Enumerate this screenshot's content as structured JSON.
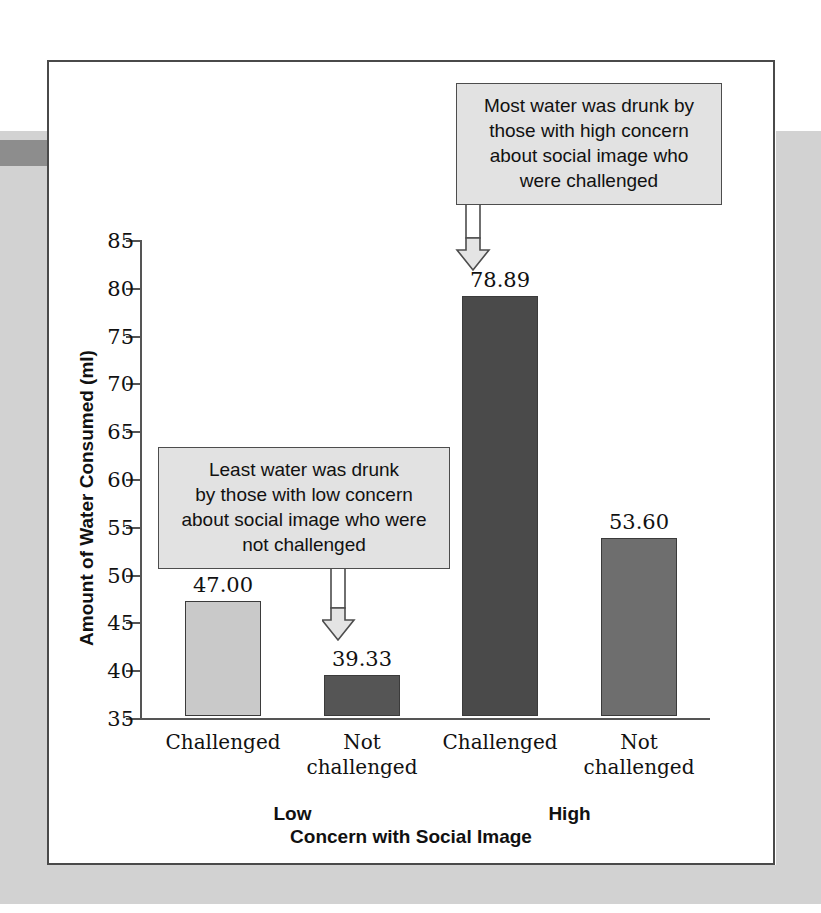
{
  "chart_data": {
    "type": "bar",
    "title": "",
    "xlabel": "Concern with Social Image",
    "ylabel": "Amount of Water Consumed (ml)",
    "ylim": [
      35,
      85
    ],
    "ytick_values": [
      85,
      80,
      75,
      70,
      65,
      60,
      55,
      50,
      45,
      40,
      35
    ],
    "ytick_labels": [
      "85",
      "80",
      "75",
      "70",
      "65",
      "60",
      "55",
      "50",
      "45",
      "40",
      "35"
    ],
    "grid": false,
    "legend": "none",
    "categories": [
      "Challenged",
      "Not challenged",
      "Challenged",
      "Not challenged"
    ],
    "group_labels": [
      "Low",
      "High"
    ],
    "values": [
      47.0,
      39.33,
      78.89,
      53.6
    ],
    "value_labels": [
      "47.00",
      "39.33",
      "78.89",
      "53.60"
    ],
    "bar_colors": [
      "#c9c9c9",
      "#555555",
      "#4a4a4a",
      "#6e6e6e"
    ],
    "bars": [
      {
        "label": "Challenged",
        "group": "Low",
        "value": 47.0,
        "value_label": "47.00",
        "color": "#c9c9c9"
      },
      {
        "label": "Not\nchallenged",
        "group": "Low",
        "value": 39.33,
        "value_label": "39.33",
        "color": "#555555"
      },
      {
        "label": "Challenged",
        "group": "High",
        "value": 78.89,
        "value_label": "78.89",
        "color": "#4a4a4a"
      },
      {
        "label": "Not\nchallenged",
        "group": "High",
        "value": 53.6,
        "value_label": "53.60",
        "color": "#6e6e6e"
      }
    ],
    "annotations": [
      {
        "id": "high-concern-challenged",
        "text": "Most water was drunk by those with high concern about social image who were challenged",
        "lines": [
          "Most water was drunk by",
          "those with high concern",
          "about social image who",
          "were challenged"
        ],
        "points_to": "Challenged (High)"
      },
      {
        "id": "low-concern-not-challenged",
        "text": "Least water was drunk by those with low concern about social image who were not challenged",
        "lines": [
          "Least water was drunk",
          "by those with low concern",
          "about social image who were",
          "not challenged"
        ],
        "points_to": "Not challenged (Low)"
      }
    ]
  },
  "colors": {
    "page_background": "#d2d2d2",
    "page_background_accent": "#8d8d8d",
    "frame_border": "#4a4a4a",
    "axis": "#555555",
    "callout_fill": "#e2e2e2",
    "callout_border": "#4d4d4d",
    "arrow_fill": "#e4e4e4",
    "arrow_border": "#4d4d4d",
    "text": "#111111"
  }
}
